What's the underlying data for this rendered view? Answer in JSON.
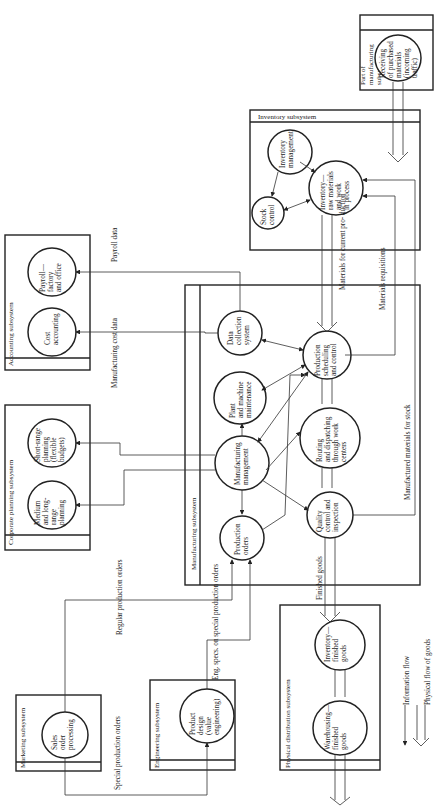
{
  "diagram": {
    "orientation": "rotated-90-ccw",
    "subsystems": {
      "accounting": {
        "title": "Accounting subsystem",
        "nodes": [
          "Payroll— factory and office",
          "Cost accounting"
        ]
      },
      "corporate_planning": {
        "title": "Corporate planning subsystem",
        "nodes": [
          "Short-range planning (flexible budgets)",
          "Medium and long-range planning"
        ]
      },
      "marketing": {
        "title": "Marketing subsystem",
        "nodes": [
          "Sales order processing"
        ]
      },
      "engineering": {
        "title": "Engineering subsystem",
        "nodes": [
          "Product design (value engineering)"
        ]
      },
      "manufacturing": {
        "title": "Manufacturing subsystem",
        "nodes": [
          "Data collection system",
          "Plant and machine maintenance",
          "Manufacturing management",
          "Production orders",
          "Production scheduling and control",
          "Routing and dispatching through work centers",
          "Quality control and inspection"
        ]
      },
      "inventory": {
        "title": "Inventory subsystem",
        "nodes": [
          "Inventory management",
          "Stock control",
          "Inventory— raw materials and work in process"
        ]
      },
      "part_of_manufacturing": {
        "title": "Part of manufacturing subsystem",
        "nodes": [
          "Receiving of purchased materials (incoming traffic)"
        ]
      },
      "physical_distribution": {
        "title": "Physical distribution subsystem",
        "nodes": [
          "Inventory— finished goods",
          "Warehousing— finished goods"
        ]
      }
    },
    "flow_labels": {
      "payroll_data": "Payroll data",
      "manufacturing_cost_data": "Manufacturing cost data",
      "regular_production_orders": "Regular production orders",
      "special_production_orders": "Special production orders",
      "eng_specs": "Eng. specs. on special production orders",
      "finished_goods": "Finished goods",
      "materials_for_current_production": "Materials for current pro- duction",
      "materials_requisitions": "Materials requisitions",
      "manufactured_materials_for_stock": "Manufactured materials for stock"
    },
    "legend": [
      {
        "symbol": "single-arrow",
        "label": "Information flow"
      },
      {
        "symbol": "double-arrow",
        "label": "Physical flow of goods"
      }
    ]
  }
}
